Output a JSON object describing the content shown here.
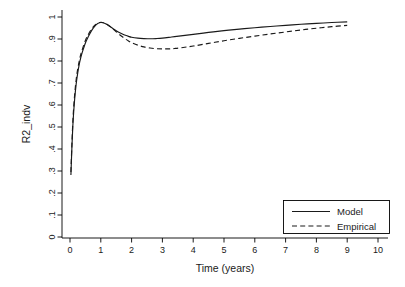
{
  "chart_data": {
    "type": "line",
    "title": "",
    "xlabel": "Time (years)",
    "ylabel": "R2_indv",
    "xlim": [
      0,
      10
    ],
    "ylim": [
      0,
      1
    ],
    "grid": false,
    "legend_position": "bottom-right",
    "xticks": [
      "0",
      "1",
      "2",
      "3",
      "4",
      "5",
      "6",
      "7",
      "8",
      "9",
      "10"
    ],
    "xtick_values": [
      0,
      1,
      2,
      3,
      4,
      5,
      6,
      7,
      8,
      9,
      10
    ],
    "yticks": [
      "0",
      ".1",
      ".2",
      ".3",
      ".4",
      ".5",
      ".6",
      ".7",
      ".8",
      ".9",
      "1"
    ],
    "ytick_values": [
      0,
      0.1,
      0.2,
      0.3,
      0.4,
      0.5,
      0.6,
      0.7,
      0.8,
      0.9,
      1
    ],
    "series": [
      {
        "name": "Model",
        "style": "solid",
        "color": "#1a1a1a",
        "x": [
          0.03,
          0.06,
          0.1,
          0.15,
          0.2,
          0.25,
          0.3,
          0.35,
          0.4,
          0.5,
          0.6,
          0.7,
          0.8,
          0.9,
          1.0,
          1.1,
          1.2,
          1.3,
          1.4,
          1.5,
          1.6,
          1.7,
          1.8,
          1.9,
          2.0,
          2.2,
          2.4,
          2.6,
          2.8,
          3.0,
          3.3,
          3.6,
          4.0,
          4.5,
          5.0,
          5.5,
          6.0,
          6.5,
          7.0,
          7.5,
          8.0,
          8.5,
          9.0
        ],
        "y": [
          0.282,
          0.4,
          0.525,
          0.625,
          0.695,
          0.745,
          0.785,
          0.815,
          0.84,
          0.882,
          0.912,
          0.938,
          0.957,
          0.97,
          0.975,
          0.973,
          0.966,
          0.957,
          0.947,
          0.938,
          0.93,
          0.923,
          0.917,
          0.912,
          0.908,
          0.904,
          0.902,
          0.901,
          0.902,
          0.904,
          0.909,
          0.914,
          0.921,
          0.93,
          0.938,
          0.945,
          0.951,
          0.957,
          0.962,
          0.967,
          0.971,
          0.975,
          0.978
        ]
      },
      {
        "name": "Empirical",
        "style": "dashed",
        "color": "#1a1a1a",
        "x": [
          0.03,
          0.06,
          0.1,
          0.15,
          0.2,
          0.25,
          0.3,
          0.35,
          0.4,
          0.5,
          0.6,
          0.7,
          0.8,
          0.9,
          1.0,
          1.1,
          1.2,
          1.3,
          1.4,
          1.5,
          1.6,
          1.7,
          1.8,
          1.9,
          2.0,
          2.2,
          2.4,
          2.6,
          2.8,
          3.0,
          3.2,
          3.4,
          3.6,
          4.0,
          4.5,
          5.0,
          5.5,
          6.0,
          6.5,
          7.0,
          7.5,
          8.0,
          8.5,
          9.0
        ],
        "y": [
          0.295,
          0.415,
          0.545,
          0.645,
          0.715,
          0.763,
          0.8,
          0.83,
          0.853,
          0.893,
          0.922,
          0.945,
          0.962,
          0.972,
          0.976,
          0.974,
          0.967,
          0.957,
          0.945,
          0.933,
          0.921,
          0.91,
          0.9,
          0.891,
          0.883,
          0.872,
          0.864,
          0.859,
          0.856,
          0.855,
          0.855,
          0.857,
          0.86,
          0.868,
          0.88,
          0.892,
          0.903,
          0.913,
          0.923,
          0.932,
          0.941,
          0.949,
          0.956,
          0.962
        ]
      }
    ]
  },
  "legend": {
    "entries": [
      {
        "label": "Model",
        "style": "solid"
      },
      {
        "label": "Empirical",
        "style": "dashed"
      }
    ]
  }
}
